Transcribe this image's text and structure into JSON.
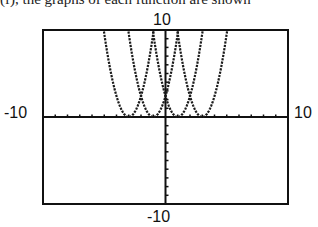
{
  "caption_fragment": "(f), the graphs of each function are shown",
  "chart_data": {
    "type": "line",
    "title": "",
    "xlabel": "",
    "ylabel": "",
    "xlim": [
      -10,
      10
    ],
    "ylim": [
      -10,
      10
    ],
    "xscale_ticks": 1,
    "yscale_ticks": 1,
    "grid": false,
    "window_labels": {
      "ymax": "10",
      "ymin": "-10",
      "xmin": "-10",
      "xmax": "10"
    },
    "series": [
      {
        "name": "parabola-1",
        "equation": "y = 2.4(x+3)^2",
        "vertex": [
          -3,
          0
        ],
        "a": 2.4
      },
      {
        "name": "parabola-2",
        "equation": "y = 2.4(x+1)^2",
        "vertex": [
          -1,
          0
        ],
        "a": 2.4
      },
      {
        "name": "parabola-3",
        "equation": "y = 2.4(x-1)^2",
        "vertex": [
          1,
          0
        ],
        "a": 2.4
      },
      {
        "name": "parabola-4",
        "equation": "y = 2.4(x-3)^2",
        "vertex": [
          3,
          0
        ],
        "a": 2.4
      }
    ]
  },
  "colors": {
    "axis": "#111111",
    "curve": "#1a1a1a",
    "frame": "#111111"
  }
}
